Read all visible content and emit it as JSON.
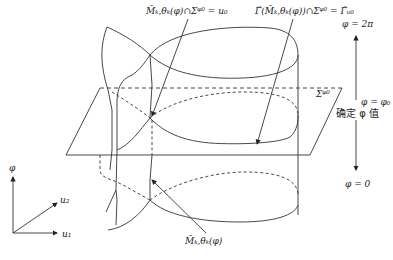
{
  "labels": {
    "top_left": "M̃_{k,θ_k}(φ)∩Σ^{φ0} = u₀",
    "top_left_display": "M̃ₖ,θₖ(φ)∩Σᵠ⁰ = u₀",
    "top_right_display": "Γ̃(M̃ₖ,θₖ(φ))∩Σᵠ⁰ = Γ̃ᵤ₀",
    "plane_label": "Σᵠ⁰",
    "phi_top": "φ = 2π",
    "phi_mid": "φ = φ₀",
    "phi_fixed": "确定 φ 值",
    "phi_bottom": "φ = 0",
    "bottom_manifold": "M̃ₖ,θₖ(φ)",
    "axis_phi": "φ",
    "axis_u1": "u₁",
    "axis_u2": "u₂"
  },
  "colors": {
    "stroke": "#333333",
    "background": "#ffffff"
  }
}
